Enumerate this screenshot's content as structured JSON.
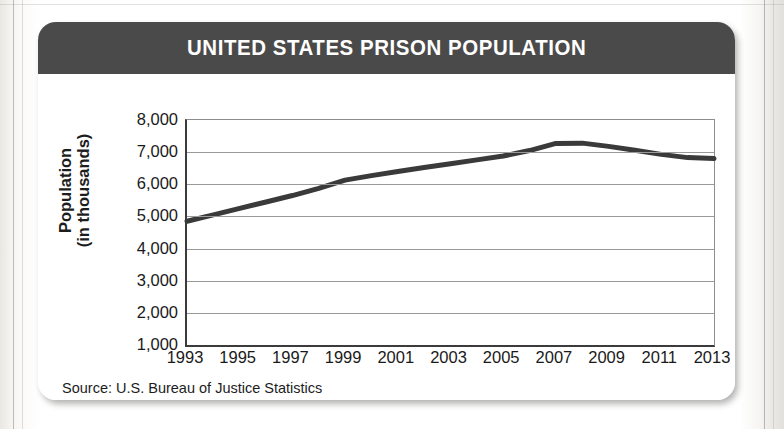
{
  "card": {
    "title": "UNITED STATES PRISON POPULATION",
    "source_note": "Source: U.S. Bureau of Justice Statistics",
    "header_color": "#4b4a4a",
    "background_color": "#ffffff"
  },
  "chart_data": {
    "type": "line",
    "title": "UNITED STATES PRISON POPULATION",
    "subtitle": "",
    "xlabel": "",
    "ylabel": "Population (in thousands)",
    "ylabel_lines": [
      "Population",
      "(in thousands)"
    ],
    "source": "Source: U.S. Bureau of Justice Statistics",
    "grid": "horizontal",
    "legend": "none",
    "line_color": "#3a3a3a",
    "line_width": 5,
    "xlim": [
      1993,
      2013
    ],
    "ylim": [
      1000,
      8000
    ],
    "ytick_labels": [
      "8,000",
      "7,000",
      "6,000",
      "5,000",
      "4,000",
      "3,000",
      "2,000",
      "1,000"
    ],
    "yticks": [
      8000,
      7000,
      6000,
      5000,
      4000,
      3000,
      2000,
      1000
    ],
    "xtick_labels": [
      "1993",
      "1995",
      "1997",
      "1999",
      "2001",
      "2003",
      "2005",
      "2007",
      "2009",
      "2011",
      "2013"
    ],
    "xticks": [
      1993,
      1995,
      1997,
      1999,
      2001,
      2003,
      2005,
      2007,
      2009,
      2011,
      2013
    ],
    "x": [
      1993,
      1994,
      1995,
      1996,
      1997,
      1998,
      1999,
      2000,
      2001,
      2002,
      2003,
      2004,
      2005,
      2006,
      2007,
      2008,
      2009,
      2010,
      2011,
      2012,
      2013
    ],
    "values": [
      4850,
      5050,
      5250,
      5450,
      5650,
      5870,
      6130,
      6270,
      6400,
      6520,
      6640,
      6760,
      6880,
      7050,
      7270,
      7280,
      7180,
      7060,
      6930,
      6830,
      6800
    ],
    "series": [
      {
        "name": "Total prison population",
        "values": [
          4850,
          5050,
          5250,
          5450,
          5650,
          5870,
          6130,
          6270,
          6400,
          6520,
          6640,
          6760,
          6880,
          7050,
          7270,
          7280,
          7180,
          7060,
          6930,
          6830,
          6800
        ]
      }
    ],
    "peak": {
      "year": 2008,
      "value": 7280
    },
    "start": {
      "year": 1993,
      "value": 4850
    },
    "end": {
      "year": 2013,
      "value": 6800
    }
  }
}
